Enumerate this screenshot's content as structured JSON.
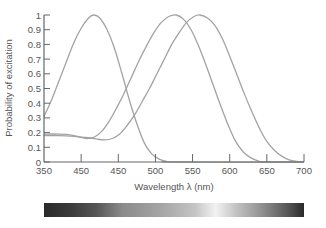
{
  "chart_data": {
    "type": "line",
    "title": "",
    "xlabel": "Wavelength λ (nm)",
    "ylabel": "Probability of excitation",
    "xlim": [
      350,
      700
    ],
    "ylim": [
      0,
      1
    ],
    "grid": false,
    "legend": null,
    "x_tick_labels": [
      "350",
      "450",
      "450",
      "500",
      "550",
      "600",
      "650",
      "700"
    ],
    "x_tick_values": [
      350,
      400,
      450,
      500,
      550,
      600,
      650,
      700
    ],
    "y_tick_labels": [
      "0",
      "0.1",
      "0.2",
      "0.3",
      "0.4",
      "0.5",
      "0.6",
      "0.7",
      "0.8",
      "0.9",
      "1"
    ],
    "y_tick_values": [
      0,
      0.1,
      0.2,
      0.3,
      0.4,
      0.5,
      0.6,
      0.7,
      0.8,
      0.9,
      1.0
    ],
    "line_color": "#a3a3a3",
    "series": [
      {
        "name": "S-cone (short wavelength)",
        "peak_nm": 417,
        "points": [
          [
            350,
            0.31
          ],
          [
            360,
            0.42
          ],
          [
            370,
            0.55
          ],
          [
            380,
            0.68
          ],
          [
            390,
            0.81
          ],
          [
            400,
            0.91
          ],
          [
            410,
            0.98
          ],
          [
            417,
            1.0
          ],
          [
            425,
            0.98
          ],
          [
            435,
            0.9
          ],
          [
            445,
            0.77
          ],
          [
            455,
            0.6
          ],
          [
            465,
            0.42
          ],
          [
            475,
            0.26
          ],
          [
            485,
            0.13
          ],
          [
            495,
            0.055
          ],
          [
            505,
            0.02
          ],
          [
            515,
            0.004
          ],
          [
            525,
            0.0
          ],
          [
            700,
            0.0
          ]
        ]
      },
      {
        "name": "M-cone (medium wavelength)",
        "peak_nm": 530,
        "points": [
          [
            350,
            0.19
          ],
          [
            370,
            0.19
          ],
          [
            385,
            0.185
          ],
          [
            398,
            0.17
          ],
          [
            408,
            0.16
          ],
          [
            418,
            0.17
          ],
          [
            428,
            0.21
          ],
          [
            438,
            0.28
          ],
          [
            448,
            0.37
          ],
          [
            458,
            0.47
          ],
          [
            468,
            0.58
          ],
          [
            478,
            0.69
          ],
          [
            488,
            0.79
          ],
          [
            498,
            0.88
          ],
          [
            508,
            0.95
          ],
          [
            518,
            0.99
          ],
          [
            528,
            1.0
          ],
          [
            538,
            0.97
          ],
          [
            548,
            0.9
          ],
          [
            558,
            0.79
          ],
          [
            568,
            0.66
          ],
          [
            578,
            0.52
          ],
          [
            588,
            0.38
          ],
          [
            598,
            0.25
          ],
          [
            608,
            0.14
          ],
          [
            618,
            0.07
          ],
          [
            628,
            0.03
          ],
          [
            638,
            0.008
          ],
          [
            648,
            0.0
          ],
          [
            700,
            0.0
          ]
        ]
      },
      {
        "name": "L-cone (long wavelength)",
        "peak_nm": 560,
        "points": [
          [
            350,
            0.18
          ],
          [
            370,
            0.18
          ],
          [
            390,
            0.175
          ],
          [
            410,
            0.165
          ],
          [
            422,
            0.155
          ],
          [
            432,
            0.15
          ],
          [
            442,
            0.16
          ],
          [
            452,
            0.19
          ],
          [
            462,
            0.25
          ],
          [
            472,
            0.32
          ],
          [
            482,
            0.41
          ],
          [
            492,
            0.5
          ],
          [
            502,
            0.6
          ],
          [
            512,
            0.7
          ],
          [
            522,
            0.8
          ],
          [
            532,
            0.88
          ],
          [
            542,
            0.95
          ],
          [
            552,
            0.99
          ],
          [
            560,
            1.0
          ],
          [
            570,
            0.98
          ],
          [
            580,
            0.93
          ],
          [
            590,
            0.84
          ],
          [
            600,
            0.72
          ],
          [
            610,
            0.59
          ],
          [
            620,
            0.46
          ],
          [
            630,
            0.34
          ],
          [
            640,
            0.23
          ],
          [
            650,
            0.14
          ],
          [
            660,
            0.08
          ],
          [
            670,
            0.04
          ],
          [
            680,
            0.015
          ],
          [
            690,
            0.004
          ],
          [
            700,
            0.0
          ]
        ]
      }
    ],
    "spectrum_bar": {
      "description": "grayscale visible spectrum strip",
      "stops": [
        {
          "offset": "0%",
          "color": "#2a2a2a"
        },
        {
          "offset": "10%",
          "color": "#3a3a3a"
        },
        {
          "offset": "20%",
          "color": "#555555"
        },
        {
          "offset": "30%",
          "color": "#8a8a8a"
        },
        {
          "offset": "45%",
          "color": "#a5a5a5"
        },
        {
          "offset": "58%",
          "color": "#c4c4c4"
        },
        {
          "offset": "66%",
          "color": "#f2f2f2"
        },
        {
          "offset": "74%",
          "color": "#c2c2c2"
        },
        {
          "offset": "85%",
          "color": "#8a8a8a"
        },
        {
          "offset": "94%",
          "color": "#555555"
        },
        {
          "offset": "100%",
          "color": "#2a2a2a"
        }
      ]
    }
  }
}
